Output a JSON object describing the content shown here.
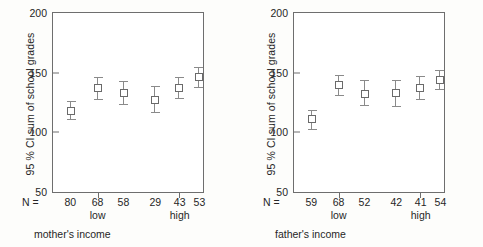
{
  "figure": {
    "background_color": "#fdfdfb",
    "axis_color": "#6e6e6e",
    "marker_color": "#6a6a6a",
    "whisker_color": "#8a8a8a",
    "caption_fragment": ""
  },
  "chart_data": [
    {
      "type": "scatter",
      "title": "",
      "xlabel": "mother's income",
      "ylabel": "95 % CI sum of school grades",
      "ylim": [
        50,
        200
      ],
      "yticks": [
        200,
        150,
        100,
        50
      ],
      "grid": false,
      "legend": "none",
      "n_prefix": "N =",
      "categories": [
        "80",
        "68",
        "58",
        "29",
        "43",
        "53"
      ],
      "group_labels": [
        {
          "label": "low",
          "under_category_index": 1
        },
        {
          "label": "high",
          "under_category_index": 4
        }
      ],
      "x_positions_pct": [
        12,
        30,
        47,
        68,
        84,
        97
      ],
      "xtick_positions_pct": [
        30,
        84
      ],
      "series": [
        {
          "name": "95 % CI sum of school grades",
          "means": [
            118,
            137,
            133,
            127,
            137,
            146
          ],
          "ci_lower": [
            111,
            128,
            124,
            117,
            129,
            138
          ],
          "ci_upper": [
            126,
            146,
            143,
            139,
            146,
            155
          ],
          "n": [
            80,
            68,
            58,
            29,
            43,
            53
          ]
        }
      ]
    },
    {
      "type": "scatter",
      "title": "",
      "xlabel": "father's income",
      "ylabel": "95 % CI sum of school grades",
      "ylim": [
        50,
        200
      ],
      "yticks": [
        200,
        150,
        100,
        50
      ],
      "grid": false,
      "legend": "none",
      "n_prefix": "N =",
      "categories": [
        "59",
        "68",
        "52",
        "42",
        "41",
        "54"
      ],
      "group_labels": [
        {
          "label": "low",
          "under_category_index": 1
        },
        {
          "label": "high",
          "under_category_index": 4
        }
      ],
      "x_positions_pct": [
        12,
        30,
        47,
        68,
        84,
        97
      ],
      "xtick_positions_pct": [
        30,
        84
      ],
      "series": [
        {
          "name": "95 % CI sum of school grades",
          "means": [
            111,
            140,
            132,
            133,
            137,
            144
          ],
          "ci_lower": [
            103,
            131,
            123,
            122,
            128,
            136
          ],
          "ci_upper": [
            119,
            148,
            144,
            144,
            147,
            152
          ],
          "n": [
            59,
            68,
            52,
            42,
            41,
            54
          ]
        }
      ]
    }
  ]
}
